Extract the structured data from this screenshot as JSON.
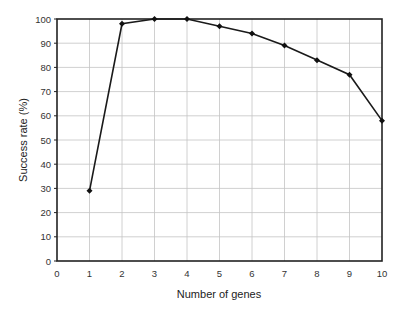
{
  "chart_data": {
    "type": "line",
    "title": "",
    "xlabel": "Number of genes",
    "ylabel": "Success rate (%)",
    "x": [
      1,
      2,
      3,
      4,
      5,
      6,
      7,
      8,
      9,
      10
    ],
    "series": [
      {
        "name": "Success rate",
        "values": [
          29,
          98,
          100,
          100,
          97,
          94,
          89,
          83,
          77,
          58
        ]
      }
    ],
    "xlim": [
      0,
      10
    ],
    "ylim": [
      0,
      100
    ],
    "xticks": [
      "0",
      "1",
      "2",
      "3",
      "4",
      "5",
      "6",
      "7",
      "8",
      "9",
      "10"
    ],
    "yticks": [
      "0",
      "10",
      "20",
      "30",
      "40",
      "50",
      "60",
      "70",
      "80",
      "90",
      "100"
    ],
    "grid": true,
    "legend": "none",
    "marker": "diamond",
    "color": "#1a1a1a"
  }
}
